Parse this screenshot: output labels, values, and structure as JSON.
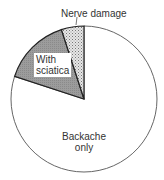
{
  "chart_data": {
    "type": "pie",
    "title": "",
    "slices": [
      {
        "label": "Backache only",
        "value": 80,
        "fill": "#ffffff",
        "pattern": "none"
      },
      {
        "label": "With sciatica",
        "value": 15,
        "fill": "#9a9a9a",
        "pattern": "dark-stipple"
      },
      {
        "label": "Nerve damage",
        "value": 5,
        "fill": "#d8d8d8",
        "pattern": "light-crosshatch"
      }
    ],
    "start_angle_deg": 0,
    "direction": "counter-clockwise-from-top for shaded slices",
    "legend": "none (direct labels)"
  },
  "labels": {
    "nerve": "Nerve damage",
    "sciatica_line1": "With",
    "sciatica_line2": "sciatica",
    "backache_line1": "Backache",
    "backache_line2": "only"
  }
}
